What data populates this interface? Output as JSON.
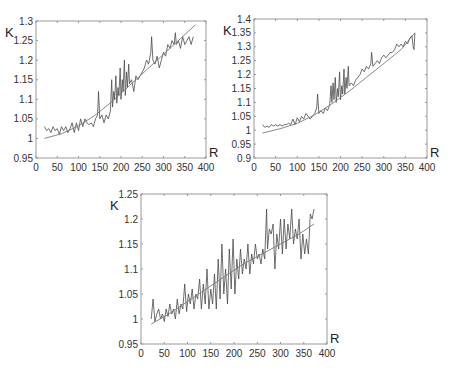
{
  "chart_data": [
    {
      "id": "top-left",
      "type": "line",
      "title": "",
      "xlabel": "R",
      "ylabel": "K",
      "xlim": [
        0,
        400
      ],
      "ylim": [
        0.95,
        1.3
      ],
      "x_ticks": [
        0,
        50,
        100,
        150,
        200,
        250,
        300,
        350,
        400
      ],
      "y_ticks": [
        0.95,
        1,
        1.05,
        1.1,
        1.15,
        1.2,
        1.25,
        1.3
      ],
      "y_tick_labels": [
        "0.95",
        "1",
        "1.05",
        "1.1",
        "1.15",
        "1.2",
        "1.25",
        "1.3"
      ],
      "grid": false,
      "legend": "none",
      "frame": {
        "left": 36,
        "top": 21,
        "right": 206,
        "bottom": 158
      },
      "series": [
        {
          "name": "measured",
          "style": "noisy",
          "x": [
            20,
            25,
            30,
            35,
            40,
            45,
            50,
            55,
            60,
            65,
            70,
            75,
            80,
            85,
            90,
            95,
            100,
            105,
            110,
            115,
            120,
            125,
            130,
            135,
            140,
            145,
            147,
            150,
            155,
            160,
            165,
            170,
            175,
            178,
            180,
            183,
            185,
            188,
            190,
            193,
            195,
            198,
            200,
            203,
            205,
            208,
            210,
            213,
            215,
            218,
            220,
            225,
            230,
            235,
            240,
            245,
            250,
            255,
            260,
            265,
            270,
            272,
            275,
            280,
            285,
            290,
            295,
            300,
            305,
            310,
            315,
            320,
            325,
            328,
            330,
            335,
            340,
            345,
            350,
            355,
            360,
            365,
            370
          ],
          "y": [
            1.03,
            1.02,
            1.025,
            1.015,
            1.03,
            1.02,
            1.025,
            1.01,
            1.03,
            1.02,
            1.03,
            1.015,
            1.025,
            1.04,
            1.015,
            1.04,
            1.02,
            1.05,
            1.03,
            1.05,
            1.04,
            1.035,
            1.04,
            1.03,
            1.05,
            1.06,
            1.12,
            1.05,
            1.06,
            1.04,
            1.06,
            1.05,
            1.07,
            1.15,
            1.08,
            1.12,
            1.1,
            1.16,
            1.09,
            1.13,
            1.11,
            1.18,
            1.1,
            1.15,
            1.12,
            1.2,
            1.11,
            1.17,
            1.13,
            1.19,
            1.14,
            1.15,
            1.12,
            1.16,
            1.15,
            1.16,
            1.17,
            1.18,
            1.2,
            1.19,
            1.22,
            1.26,
            1.2,
            1.19,
            1.21,
            1.18,
            1.2,
            1.22,
            1.21,
            1.24,
            1.23,
            1.25,
            1.24,
            1.27,
            1.24,
            1.25,
            1.23,
            1.26,
            1.24,
            1.25,
            1.26,
            1.24,
            1.26
          ]
        },
        {
          "name": "fit",
          "style": "smooth",
          "x": [
            20,
            60,
            100,
            140,
            180,
            220,
            260,
            300,
            340,
            375
          ],
          "y": [
            1.0,
            1.012,
            1.032,
            1.06,
            1.095,
            1.135,
            1.175,
            1.215,
            1.255,
            1.29
          ]
        }
      ]
    },
    {
      "id": "top-right",
      "type": "line",
      "title": "",
      "xlabel": "R",
      "ylabel": "K",
      "xlim": [
        0,
        400
      ],
      "ylim": [
        0.9,
        1.4
      ],
      "x_ticks": [
        0,
        50,
        100,
        150,
        200,
        250,
        300,
        350,
        400
      ],
      "y_ticks": [
        0.9,
        0.95,
        1,
        1.05,
        1.1,
        1.15,
        1.2,
        1.25,
        1.3,
        1.35,
        1.4
      ],
      "y_tick_labels": [
        "0.9",
        "0.95",
        "1",
        "1.05",
        "1.1",
        "1.15",
        "1.2",
        "1.25",
        "1.3",
        "1.35",
        "1.4"
      ],
      "grid": false,
      "legend": "none",
      "frame": {
        "left": 254,
        "top": 19,
        "right": 427,
        "bottom": 158
      },
      "series": [
        {
          "name": "measured",
          "style": "noisy",
          "x": [
            20,
            25,
            30,
            35,
            40,
            45,
            50,
            55,
            60,
            65,
            70,
            75,
            80,
            85,
            90,
            95,
            100,
            105,
            110,
            115,
            120,
            125,
            130,
            135,
            140,
            145,
            147,
            150,
            155,
            160,
            165,
            170,
            175,
            178,
            180,
            183,
            185,
            188,
            190,
            193,
            195,
            198,
            200,
            203,
            205,
            208,
            210,
            213,
            215,
            218,
            220,
            225,
            230,
            235,
            240,
            245,
            250,
            255,
            260,
            265,
            270,
            272,
            275,
            280,
            285,
            290,
            295,
            300,
            305,
            310,
            315,
            320,
            325,
            330,
            335,
            340,
            345,
            350,
            355,
            360,
            365,
            368,
            370,
            372
          ],
          "y": [
            1.02,
            1.01,
            1.015,
            1.01,
            1.02,
            1.015,
            1.02,
            1.015,
            1.02,
            1.015,
            1.02,
            1.02,
            1.025,
            1.02,
            1.04,
            1.02,
            1.045,
            1.03,
            1.05,
            1.04,
            1.06,
            1.05,
            1.04,
            1.05,
            1.06,
            1.08,
            1.13,
            1.06,
            1.07,
            1.06,
            1.08,
            1.07,
            1.09,
            1.16,
            1.1,
            1.17,
            1.11,
            1.19,
            1.1,
            1.15,
            1.12,
            1.21,
            1.11,
            1.16,
            1.13,
            1.22,
            1.13,
            1.19,
            1.15,
            1.23,
            1.16,
            1.17,
            1.16,
            1.18,
            1.19,
            1.2,
            1.22,
            1.21,
            1.23,
            1.22,
            1.24,
            1.28,
            1.23,
            1.24,
            1.25,
            1.24,
            1.26,
            1.27,
            1.26,
            1.27,
            1.28,
            1.28,
            1.29,
            1.31,
            1.3,
            1.31,
            1.3,
            1.32,
            1.31,
            1.33,
            1.34,
            1.3,
            1.29,
            1.35
          ]
        },
        {
          "name": "fit",
          "style": "smooth",
          "x": [
            20,
            60,
            100,
            140,
            180,
            220,
            260,
            300,
            340,
            372
          ],
          "y": [
            0.99,
            1.005,
            1.025,
            1.055,
            1.095,
            1.14,
            1.19,
            1.24,
            1.29,
            1.35
          ]
        }
      ]
    },
    {
      "id": "bottom",
      "type": "line",
      "title": "",
      "xlabel": "R",
      "ylabel": "K",
      "xlim": [
        0,
        400
      ],
      "ylim": [
        0.95,
        1.25
      ],
      "x_ticks": [
        0,
        50,
        100,
        150,
        200,
        250,
        300,
        350,
        400
      ],
      "y_ticks": [
        0.95,
        1,
        1.05,
        1.1,
        1.15,
        1.2,
        1.25
      ],
      "y_tick_labels": [
        "0.95",
        "1",
        "1.05",
        "1.1",
        "1.15",
        "1.2",
        "1.25"
      ],
      "grid": false,
      "legend": "none",
      "frame": {
        "left": 141,
        "top": 194,
        "right": 327,
        "bottom": 344
      },
      "series": [
        {
          "name": "measured",
          "style": "noisy",
          "x": [
            22,
            26,
            30,
            34,
            38,
            42,
            46,
            50,
            54,
            58,
            62,
            66,
            70,
            74,
            78,
            82,
            86,
            90,
            94,
            98,
            102,
            106,
            110,
            114,
            118,
            122,
            126,
            130,
            134,
            138,
            142,
            146,
            150,
            154,
            158,
            162,
            166,
            170,
            174,
            178,
            182,
            186,
            190,
            194,
            198,
            202,
            206,
            210,
            214,
            218,
            222,
            226,
            230,
            234,
            238,
            242,
            246,
            250,
            254,
            258,
            262,
            266,
            270,
            272,
            276,
            280,
            284,
            288,
            292,
            296,
            300,
            304,
            308,
            312,
            316,
            320,
            324,
            328,
            332,
            336,
            340,
            344,
            348,
            352,
            356,
            360,
            364,
            368,
            372
          ],
          "y": [
            1.0,
            1.04,
            0.995,
            1.01,
            1.02,
            1.0,
            1.01,
            0.995,
            1.02,
            1.005,
            1.03,
            1.01,
            1.02,
            1.0,
            1.04,
            1.01,
            1.03,
            1.02,
            1.07,
            1.015,
            1.05,
            1.03,
            1.06,
            1.02,
            1.05,
            1.04,
            1.08,
            1.02,
            1.07,
            1.03,
            1.1,
            1.02,
            1.06,
            1.03,
            1.09,
            1.02,
            1.12,
            1.04,
            1.15,
            1.05,
            1.1,
            1.03,
            1.14,
            1.06,
            1.16,
            1.05,
            1.12,
            1.08,
            1.14,
            1.09,
            1.12,
            1.1,
            1.15,
            1.09,
            1.13,
            1.11,
            1.15,
            1.12,
            1.13,
            1.11,
            1.14,
            1.12,
            1.22,
            1.14,
            1.18,
            1.17,
            1.19,
            1.1,
            1.17,
            1.14,
            1.2,
            1.13,
            1.2,
            1.14,
            1.19,
            1.16,
            1.22,
            1.15,
            1.18,
            1.16,
            1.2,
            1.12,
            1.17,
            1.13,
            1.16,
            1.13,
            1.21,
            1.2,
            1.22
          ]
        },
        {
          "name": "fit",
          "style": "smooth",
          "x": [
            22,
            60,
            100,
            140,
            180,
            220,
            260,
            300,
            340,
            372
          ],
          "y": [
            0.99,
            1.01,
            1.035,
            1.06,
            1.085,
            1.11,
            1.13,
            1.15,
            1.17,
            1.19
          ]
        }
      ]
    }
  ]
}
